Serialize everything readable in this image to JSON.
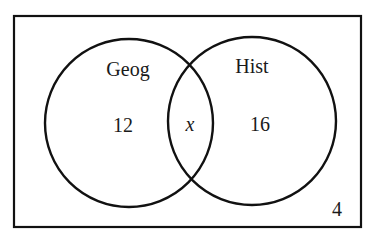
{
  "diagram": {
    "type": "venn",
    "universe": {
      "value": "4"
    },
    "sets": [
      {
        "name": "Geog",
        "only_value": "12"
      },
      {
        "name": "Hist",
        "only_value": "16"
      }
    ],
    "intersection": {
      "value": "x"
    },
    "colors": {
      "stroke": "#111111",
      "background": "#ffffff"
    }
  }
}
